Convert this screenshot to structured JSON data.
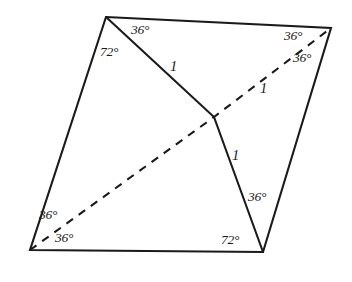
{
  "figure": {
    "type": "geometry-diagram",
    "stroke_color": "#1a1a1a",
    "background_color": "#ffffff",
    "vertices": {
      "top_left": {
        "x": 106,
        "y": 17
      },
      "top_right": {
        "x": 331,
        "y": 28
      },
      "bottom_left": {
        "x": 30,
        "y": 250
      },
      "bottom_right": {
        "x": 263,
        "y": 252
      },
      "junction": {
        "x": 214,
        "y": 117
      }
    },
    "paths": {
      "outline": "M106,17 L331,28 L263,252 L30,250 Z",
      "solid_zigzag": "M106,17 L214,117 L263,252",
      "dashed_diagonal": "M30,250 L214,117 L331,28"
    },
    "angle_labels": [
      {
        "name": "top-left-inner-36",
        "text": "36°",
        "vertex": "top_left"
      },
      {
        "name": "top-left-outer-72",
        "text": "72°",
        "vertex": "top_left"
      },
      {
        "name": "top-right-upper-36",
        "text": "36°",
        "vertex": "top_right"
      },
      {
        "name": "top-right-lower-36",
        "text": "36°",
        "vertex": "top_right"
      },
      {
        "name": "bottom-left-upper-36",
        "text": "36°",
        "vertex": "bottom_left"
      },
      {
        "name": "bottom-left-lower-36",
        "text": "36°",
        "vertex": "bottom_left"
      },
      {
        "name": "bottom-right-wedge-36",
        "text": "36°",
        "vertex": "bottom_right"
      },
      {
        "name": "bottom-right-base-72",
        "text": "72°",
        "vertex": "bottom_right"
      }
    ],
    "length_labels": [
      {
        "name": "upper-solid-segment",
        "text": "1",
        "segment": "top_left-junction"
      },
      {
        "name": "dashed-upper-segment",
        "text": "1",
        "segment": "junction-top_right"
      },
      {
        "name": "lower-solid-segment",
        "text": "1",
        "segment": "junction-bottom_right"
      }
    ]
  }
}
